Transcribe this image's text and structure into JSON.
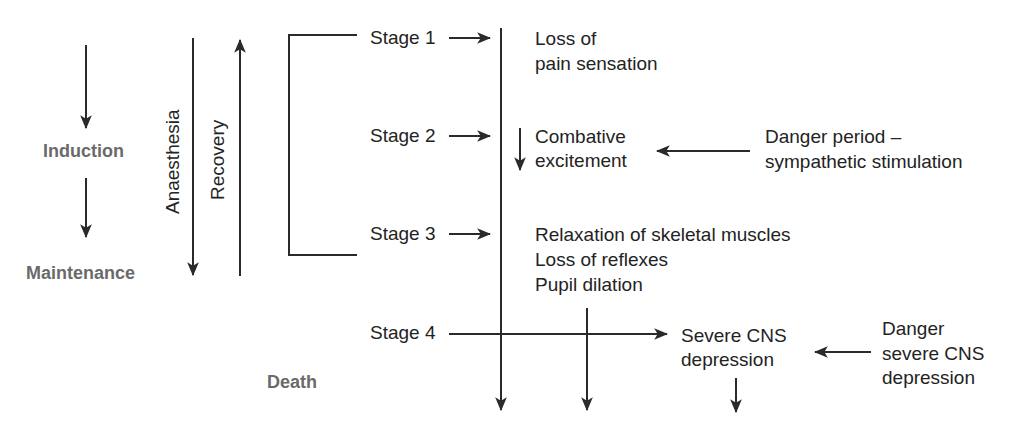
{
  "phases": {
    "induction": "Induction",
    "maintenance": "Maintenance",
    "death": "Death",
    "anaesthesia": "Anaesthesia",
    "recovery": "Recovery"
  },
  "stages": [
    {
      "label": "Stage 1",
      "effects": [
        "Loss of",
        "pain sensation"
      ]
    },
    {
      "label": "Stage 2",
      "effects": [
        "Combative",
        "excitement"
      ]
    },
    {
      "label": "Stage 3",
      "effects": [
        "Relaxation of skeletal muscles",
        "Loss of reflexes",
        "Pupil dilation"
      ]
    },
    {
      "label": "Stage 4",
      "effects": [
        "Severe CNS",
        "depression"
      ]
    }
  ],
  "dangers": {
    "stage2": [
      "Danger period –",
      "sympathetic stimulation"
    ],
    "stage4": [
      "Danger",
      "severe CNS",
      "depression"
    ]
  },
  "colors": {
    "line": "#2a2a2a",
    "phase_text": "#6a6a6a",
    "text": "#232323"
  }
}
